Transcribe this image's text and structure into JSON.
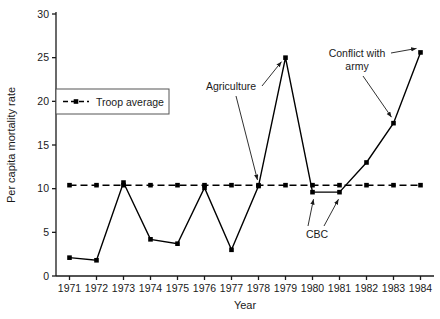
{
  "chart_data": {
    "type": "line",
    "title": "",
    "xlabel": "Year",
    "ylabel": "Per capita mortality rate",
    "categories": [
      1971,
      1972,
      1973,
      1974,
      1975,
      1976,
      1977,
      1978,
      1979,
      1980,
      1981,
      1982,
      1983,
      1984
    ],
    "x_tick_labels": [
      "1971",
      "1972",
      "1973",
      "1974",
      "1975",
      "1976",
      "1977",
      "1978",
      "1979",
      "1980",
      "1981",
      "1982",
      "1983",
      "1984"
    ],
    "y_tick_labels": [
      "0",
      "5",
      "10",
      "15",
      "20",
      "25",
      "30"
    ],
    "y_ticks": [
      0,
      5,
      10,
      15,
      20,
      25,
      30
    ],
    "xlim": [
      1970.5,
      1984.5
    ],
    "ylim": [
      0,
      30
    ],
    "grid": false,
    "series": [
      {
        "name": "Per capita mortality rate",
        "style": "solid",
        "marker": "square",
        "color": "#000000",
        "values": [
          2.1,
          1.8,
          10.7,
          4.2,
          3.7,
          10.1,
          3.0,
          10.3,
          25.0,
          9.6,
          9.6,
          13.0,
          17.5,
          25.6
        ]
      },
      {
        "name": "Troop average",
        "style": "dashed",
        "marker": "square",
        "color": "#000000",
        "values": [
          10.4,
          10.4,
          10.4,
          10.4,
          10.4,
          10.4,
          10.4,
          10.4,
          10.4,
          10.4,
          10.4,
          10.4,
          10.4,
          10.4
        ]
      }
    ],
    "legend": {
      "position": "upper-left",
      "entries": [
        {
          "label": "Troop average",
          "style": "dashed",
          "marker": "square"
        }
      ]
    },
    "annotations": [
      {
        "label": "Agriculture",
        "points": [
          {
            "year": 1978,
            "value": 10.3
          },
          {
            "year": 1979,
            "value": 25.0
          }
        ]
      },
      {
        "label": "CBC",
        "points": [
          {
            "year": 1980,
            "value": 9.6
          },
          {
            "year": 1981,
            "value": 9.6
          }
        ]
      },
      {
        "label": "Conflict with army",
        "line1": "Conflict with",
        "line2": "army",
        "points": [
          {
            "year": 1983,
            "value": 17.5
          },
          {
            "year": 1984,
            "value": 25.6
          }
        ]
      }
    ]
  },
  "colors": {
    "background": "#ffffff",
    "ink": "#1a1a1a",
    "line": "#000000",
    "axis": "#4a4a4a"
  }
}
